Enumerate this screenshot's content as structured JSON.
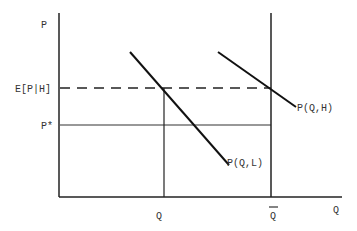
{
  "diagram": {
    "axes": {
      "y_label": "P",
      "x_label": "Q"
    },
    "price_labels": {
      "expected_price": "E[P|H]",
      "p_star": "P*"
    },
    "quantity_labels": {
      "q": "Q",
      "q_bar": "Q"
    },
    "curves": [
      {
        "label": "P(Q,L)"
      },
      {
        "label": "P(Q,H)"
      }
    ],
    "colors": {
      "line": "#111111",
      "text": "#333333",
      "background": "#ffffff"
    }
  }
}
